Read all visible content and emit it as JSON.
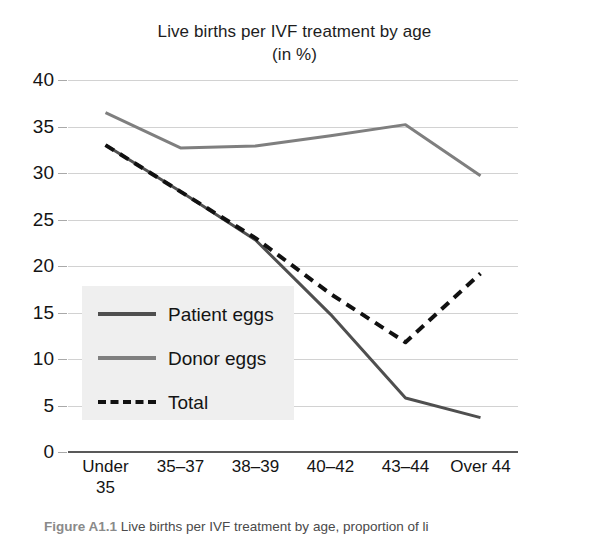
{
  "chart_data": {
    "type": "line",
    "title": "Live births per IVF treatment by age",
    "subtitle": "(in %)",
    "xlabel": "",
    "ylabel": "",
    "ylim": [
      0,
      40
    ],
    "ytick_step": 5,
    "yticks": [
      "0",
      "5",
      "10",
      "15",
      "20",
      "25",
      "30",
      "35",
      "40"
    ],
    "grid": true,
    "legend_position": "inside-left",
    "categories": [
      "Under 35",
      "35–37",
      "38–39",
      "40–42",
      "43–44",
      "Over 44"
    ],
    "series": [
      {
        "name": "Patient eggs",
        "style": "solid",
        "color": "#4f4f4f",
        "values": [
          33.0,
          28.0,
          22.8,
          14.8,
          5.8,
          3.7
        ]
      },
      {
        "name": "Donor eggs",
        "style": "solid",
        "color": "#7f7f7f",
        "values": [
          36.5,
          32.7,
          32.9,
          34.0,
          35.2,
          29.7
        ]
      },
      {
        "name": "Total",
        "style": "dashed",
        "color": "#111111",
        "values": [
          33.0,
          28.0,
          23.0,
          17.0,
          11.8,
          19.2
        ]
      }
    ]
  },
  "caption": {
    "figure_number": "Figure A1.1",
    "text": "Live births per IVF treatment by age, proportion of li"
  }
}
